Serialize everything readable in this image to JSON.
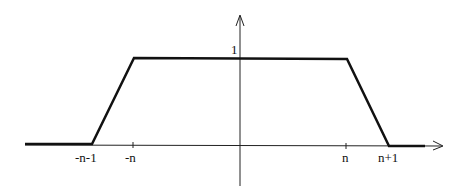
{
  "diagram": {
    "type": "piecewise-linear-trapezoid",
    "y_axis": {
      "tick_label": "1"
    },
    "x_axis": {
      "tick_labels": [
        "-n-1",
        "-n",
        "n",
        "n+1"
      ]
    },
    "function_points": [
      {
        "x": "-inf",
        "y": 0
      },
      {
        "x": "-n-1",
        "y": 0
      },
      {
        "x": "-n",
        "y": 1
      },
      {
        "x": "n",
        "y": 1
      },
      {
        "x": "n+1",
        "y": 0
      },
      {
        "x": "+inf",
        "y": 0
      }
    ],
    "colors": {
      "line": "#111111",
      "axis": "#222222",
      "background": "#ffffff"
    }
  }
}
